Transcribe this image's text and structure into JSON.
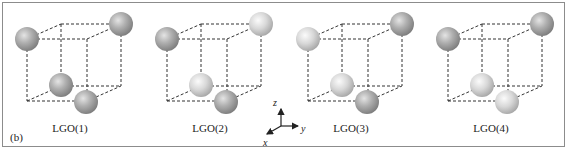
{
  "figure": {
    "panel_tag": "(b)",
    "panels": [
      {
        "label": "LGO(1)",
        "offset_x": 0,
        "spheres": {
          "top_left": "dark",
          "top_right": "dark",
          "bottom_back": "dark",
          "bottom_front": "dark"
        }
      },
      {
        "label": "LGO(2)",
        "offset_x": 140,
        "spheres": {
          "top_left": "dark",
          "top_right": "light",
          "bottom_back": "light",
          "bottom_front": "dark"
        }
      },
      {
        "label": "LGO(3)",
        "offset_x": 281,
        "spheres": {
          "top_left": "light",
          "top_right": "dark",
          "bottom_back": "light",
          "bottom_front": "dark"
        }
      },
      {
        "label": "LGO(4)",
        "offset_x": 421,
        "spheres": {
          "top_left": "dark",
          "top_right": "dark",
          "bottom_back": "light",
          "bottom_front": "light"
        }
      }
    ],
    "axes": {
      "z": "z",
      "y": "y",
      "x": "x"
    },
    "colors": {
      "dark": "#9a9a9a",
      "light": "#d6d6d6",
      "dash": "#333333",
      "frame": "#8c8c8c"
    }
  }
}
